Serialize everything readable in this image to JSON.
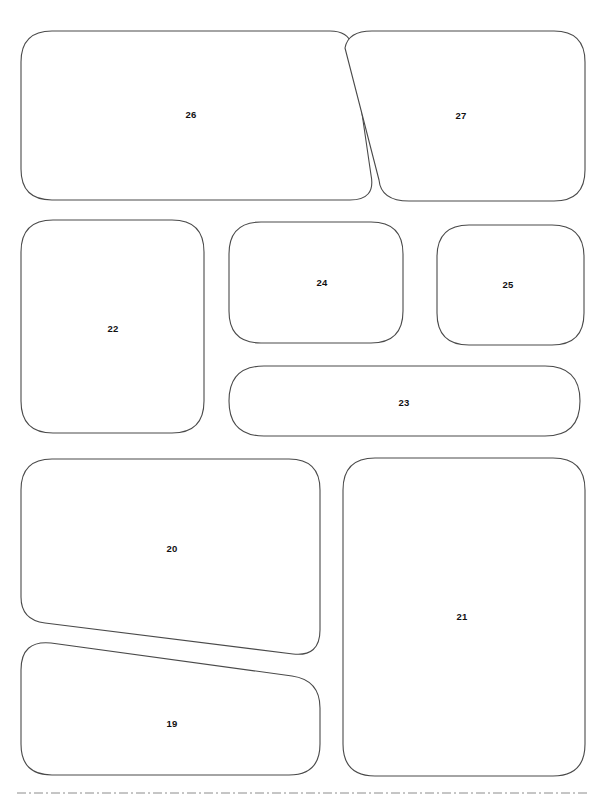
{
  "page": {
    "background_color": "#ffffff",
    "width": 598,
    "height": 802
  },
  "style": {
    "outline_color": "#4a4a4a",
    "outline_width": 1.1,
    "fill_color": "#ffffff",
    "label_color": "#111111",
    "label_font_size": 9.5,
    "divider_color": "#8c8c8c"
  },
  "shapes": [
    {
      "id": "shape-26",
      "label": "26",
      "row": "top",
      "label_x": 191,
      "label_y": 115,
      "bbox": [
        21,
        31,
        362,
        200
      ],
      "path": "M 21 62 Q 21 31 52 31 L 330 31 Q 348 31 352 45 L 371 175 Q 376 200 350 200 L 52 200 Q 21 200 21 169 Z"
    },
    {
      "id": "shape-27",
      "label": "27",
      "row": "top",
      "label_x": 461,
      "label_y": 116,
      "bbox": [
        345,
        31,
        585,
        201
      ],
      "path": "M 345 48 Q 348 31 372 31 L 554 31 Q 585 31 585 62 L 585 170 Q 585 201 554 201 L 409 201 Q 381 201 379 180 Z"
    },
    {
      "id": "shape-22",
      "label": "22",
      "row": "middle",
      "label_x": 113,
      "label_y": 329,
      "bbox": [
        21,
        220,
        204,
        433
      ],
      "path": "M 21 252 Q 21 220 53 220 L 172 220 Q 204 220 204 252 L 204 401 Q 204 433 172 433 L 53 433 Q 21 433 21 401 Z"
    },
    {
      "id": "shape-24",
      "label": "24",
      "row": "middle",
      "label_x": 322,
      "label_y": 283,
      "bbox": [
        229,
        222,
        403,
        343
      ],
      "path": "M 229 254 Q 229 222 261 222 L 371 222 Q 403 222 403 254 L 403 311 Q 403 343 371 343 L 261 343 Q 229 343 229 311 Z"
    },
    {
      "id": "shape-25",
      "label": "25",
      "row": "middle",
      "label_x": 508,
      "label_y": 285,
      "bbox": [
        437,
        225,
        584,
        345
      ],
      "path": "M 437 257 Q 437 225 469 225 L 552 225 Q 584 225 584 257 L 584 313 Q 584 345 552 345 L 469 345 Q 437 345 437 313 Z"
    },
    {
      "id": "shape-23",
      "label": "23",
      "row": "middle",
      "label_x": 404,
      "label_y": 403,
      "bbox": [
        229,
        366,
        580,
        436
      ],
      "path": "M 264 366 L 545 366 Q 580 366 580 401 Q 580 436 545 436 L 264 436 Q 229 436 229 401 Q 229 366 264 366 Z"
    },
    {
      "id": "shape-20",
      "label": "20",
      "row": "bottom",
      "label_x": 172,
      "label_y": 549,
      "bbox": [
        21,
        459,
        320,
        657
      ],
      "path": "M 21 490 Q 21 459 52 459 L 289 459 Q 320 459 320 490 L 320 630 Q 320 657 293 654 L 45 623 Q 21 620 21 597 Z"
    },
    {
      "id": "shape-19",
      "label": "19",
      "row": "bottom",
      "label_x": 172,
      "label_y": 724,
      "bbox": [
        21,
        640,
        320,
        775
      ],
      "path": "M 21 670 Q 21 640 51 643 L 292 676 Q 320 680 320 708 L 320 744 Q 320 775 289 775 L 52 775 Q 21 775 21 744 Z"
    },
    {
      "id": "shape-21",
      "label": "21",
      "row": "bottom",
      "label_x": 462,
      "label_y": 617,
      "bbox": [
        343,
        458,
        585,
        776
      ],
      "path": "M 343 490 Q 343 458 375 458 L 553 458 Q 585 458 585 490 L 585 744 Q 585 776 553 776 L 375 776 Q 343 776 343 744 Z"
    }
  ],
  "footer_divider": {
    "name": "dashed-divider",
    "x_start": 17,
    "x_end": 590,
    "y": 793,
    "dash_pattern": "9 3 2 3"
  }
}
